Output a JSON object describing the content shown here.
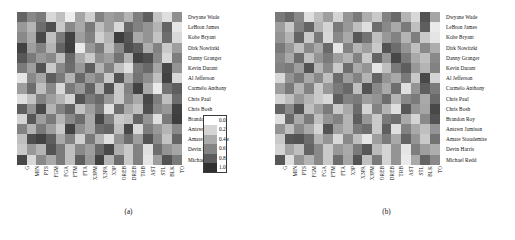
{
  "figure": {
    "panels": [
      {
        "id": "a",
        "caption": "(a)"
      },
      {
        "id": "b",
        "caption": "(b)"
      }
    ]
  },
  "legend": {
    "ticks": [
      "0.0",
      "0.2",
      "0.4",
      "0.6",
      "0.8",
      "1.0"
    ],
    "colors": [
      "#ffffff",
      "#d4d4d4",
      "#ababab",
      "#848484",
      "#5c5c5c",
      "#303030"
    ]
  },
  "chart_data": [
    {
      "type": "heatmap",
      "title": "(a)",
      "xlabel": "",
      "ylabel": "",
      "colormap": "greys",
      "zlim": [
        0.0,
        1.0
      ],
      "grid": false,
      "legend_position": "right",
      "categories": [
        "G",
        "MIN",
        "PTS",
        "FGM",
        "FGA",
        "FTM",
        "FTA",
        "X3PM",
        "X3PA",
        "X3P",
        "OREB",
        "DREB",
        "TRB",
        "AST",
        "STL",
        "BLK",
        "TO"
      ],
      "rows": [
        "Dwyane Wade",
        "LeBron James",
        "Kobe Bryant",
        "Dirk Nowitzki",
        "Danny Granger",
        "Kevin Durant",
        "Al Jefferson",
        "Carmelo Anthony",
        "Chris Paul",
        "Chris Bosh",
        "Brandon Roy",
        "Antawn Jamison",
        "Amare Stoudemire",
        "Devin Harris",
        "Michael Redd"
      ],
      "values": [
        [
          0.72,
          0.55,
          0.62,
          0.18,
          0.3,
          0.08,
          0.42,
          0.22,
          0.58,
          0.45,
          0.5,
          0.35,
          0.6,
          0.75,
          0.28,
          0.15,
          0.52
        ],
        [
          0.48,
          0.35,
          0.68,
          0.82,
          0.25,
          0.55,
          0.4,
          0.62,
          0.3,
          0.45,
          0.18,
          0.7,
          0.58,
          0.5,
          0.35,
          0.72,
          0.12
        ],
        [
          0.55,
          0.4,
          0.85,
          0.3,
          0.62,
          0.88,
          0.45,
          0.58,
          0.22,
          0.35,
          0.9,
          0.78,
          0.4,
          0.5,
          0.28,
          0.68,
          0.18
        ],
        [
          0.88,
          0.45,
          0.58,
          0.35,
          0.72,
          0.9,
          0.1,
          0.48,
          0.62,
          0.3,
          0.55,
          0.82,
          0.75,
          0.38,
          0.58,
          0.25,
          0.45
        ],
        [
          0.78,
          0.62,
          0.48,
          0.55,
          0.3,
          0.7,
          0.4,
          0.25,
          0.52,
          0.45,
          0.65,
          0.35,
          0.88,
          0.82,
          0.55,
          0.18,
          0.6
        ],
        [
          0.62,
          0.45,
          0.8,
          0.25,
          0.55,
          0.68,
          0.48,
          0.75,
          0.35,
          0.58,
          0.3,
          0.15,
          0.62,
          0.7,
          0.42,
          0.85,
          0.5
        ],
        [
          0.12,
          0.55,
          0.42,
          0.75,
          0.62,
          0.35,
          0.7,
          0.48,
          0.58,
          0.25,
          0.8,
          0.4,
          0.65,
          0.52,
          0.3,
          0.88,
          0.18
        ],
        [
          0.45,
          0.68,
          0.3,
          0.55,
          0.18,
          0.62,
          0.48,
          0.72,
          0.35,
          0.8,
          0.25,
          0.58,
          0.88,
          0.4,
          0.1,
          0.65,
          0.75
        ],
        [
          0.15,
          0.28,
          0.58,
          0.45,
          0.35,
          0.2,
          0.8,
          0.62,
          0.7,
          0.48,
          0.25,
          0.55,
          0.4,
          0.85,
          0.6,
          0.3,
          0.68
        ],
        [
          0.75,
          0.5,
          0.85,
          0.35,
          0.58,
          0.72,
          0.28,
          0.45,
          0.62,
          0.15,
          0.68,
          0.4,
          0.3,
          0.82,
          0.55,
          0.48,
          0.88
        ],
        [
          0.2,
          0.78,
          0.45,
          0.62,
          0.35,
          0.55,
          0.68,
          0.4,
          0.85,
          0.58,
          0.25,
          0.3,
          0.72,
          0.5,
          0.15,
          0.62,
          0.9
        ],
        [
          0.58,
          0.35,
          0.62,
          0.45,
          0.25,
          0.88,
          0.52,
          0.4,
          0.68,
          0.72,
          0.3,
          0.85,
          0.18,
          0.6,
          0.48,
          0.35,
          0.55
        ],
        [
          0.3,
          0.82,
          0.88,
          0.75,
          0.4,
          0.58,
          0.22,
          0.62,
          0.35,
          0.15,
          0.5,
          0.68,
          0.45,
          0.8,
          0.55,
          0.28,
          0.72
        ],
        [
          0.25,
          0.48,
          0.35,
          0.8,
          0.62,
          0.3,
          0.55,
          0.45,
          0.7,
          0.85,
          0.38,
          0.25,
          0.58,
          0.15,
          0.68,
          0.5,
          0.42
        ],
        [
          0.85,
          0.18,
          0.55,
          0.4,
          0.62,
          0.3,
          0.75,
          0.48,
          0.88,
          0.35,
          0.68,
          0.25,
          0.58,
          0.12,
          0.45,
          0.8,
          0.62
        ]
      ]
    },
    {
      "type": "heatmap",
      "title": "(b)",
      "xlabel": "",
      "ylabel": "",
      "colormap": "greys",
      "zlim": [
        0.0,
        1.0
      ],
      "grid": false,
      "legend_position": "right",
      "categories": [
        "G",
        "MIN",
        "PTS",
        "FGM",
        "FGA",
        "FTM",
        "FTA",
        "X3P",
        "X3PA",
        "X3PM",
        "OREB",
        "DREB",
        "TRB",
        "AST",
        "STL",
        "BLK",
        "TO"
      ],
      "rows": [
        "Dwyane Wade",
        "LeBron James",
        "Kobe Bryant",
        "Dirk Nowitzki",
        "Danny Granger",
        "Kevin Durant",
        "Al Jefferson",
        "Carmelo Anthony",
        "Chris Paul",
        "Chris Bosh",
        "Brandon Roy",
        "Antawn Jamison",
        "Amare Stoudemire",
        "Devin Harris",
        "Michael Redd"
      ],
      "values": [
        [
          0.62,
          0.7,
          0.55,
          0.15,
          0.3,
          0.45,
          0.2,
          0.5,
          0.62,
          0.38,
          0.25,
          0.58,
          0.7,
          0.35,
          0.18,
          0.8,
          0.42
        ],
        [
          0.45,
          0.25,
          0.58,
          0.72,
          0.35,
          0.2,
          0.62,
          0.48,
          0.3,
          0.15,
          0.68,
          0.55,
          0.4,
          0.62,
          0.3,
          0.75,
          0.1
        ],
        [
          0.5,
          0.35,
          0.72,
          0.25,
          0.62,
          0.18,
          0.55,
          0.4,
          0.78,
          0.65,
          0.3,
          0.48,
          0.58,
          0.35,
          0.6,
          0.25,
          0.12
        ],
        [
          0.62,
          0.48,
          0.3,
          0.55,
          0.4,
          0.7,
          0.12,
          0.58,
          0.35,
          0.45,
          0.25,
          0.8,
          0.68,
          0.5,
          0.3,
          0.55,
          0.38
        ],
        [
          0.55,
          0.4,
          0.68,
          0.3,
          0.5,
          0.62,
          0.45,
          0.35,
          0.58,
          0.25,
          0.72,
          0.48,
          0.85,
          0.62,
          0.4,
          0.3,
          0.55
        ],
        [
          0.58,
          0.62,
          0.45,
          0.8,
          0.35,
          0.55,
          0.25,
          0.68,
          0.4,
          0.5,
          0.12,
          0.3,
          0.62,
          0.75,
          0.48,
          0.35,
          0.58
        ],
        [
          0.18,
          0.5,
          0.62,
          0.4,
          0.55,
          0.3,
          0.68,
          0.45,
          0.58,
          0.35,
          0.72,
          0.5,
          0.4,
          0.62,
          0.25,
          0.85,
          0.2
        ],
        [
          0.45,
          0.62,
          0.35,
          0.58,
          0.25,
          0.48,
          0.62,
          0.7,
          0.3,
          0.8,
          0.55,
          0.4,
          0.68,
          0.15,
          0.5,
          0.75,
          0.62
        ],
        [
          0.2,
          0.3,
          0.48,
          0.35,
          0.25,
          0.18,
          0.75,
          0.58,
          0.62,
          0.45,
          0.5,
          0.68,
          0.35,
          0.55,
          0.62,
          0.4,
          0.7
        ],
        [
          0.72,
          0.55,
          0.8,
          0.3,
          0.45,
          0.62,
          0.25,
          0.4,
          0.68,
          0.2,
          0.58,
          0.35,
          0.15,
          0.78,
          0.5,
          0.42,
          0.85
        ],
        [
          0.15,
          0.7,
          0.4,
          0.62,
          0.3,
          0.5,
          0.58,
          0.35,
          0.75,
          0.48,
          0.25,
          0.62,
          0.68,
          0.4,
          0.2,
          0.55,
          0.8
        ],
        [
          0.5,
          0.3,
          0.55,
          0.4,
          0.2,
          0.8,
          0.45,
          0.35,
          0.62,
          0.68,
          0.25,
          0.75,
          0.15,
          0.58,
          0.4,
          0.3,
          0.5
        ],
        [
          0.25,
          0.78,
          0.8,
          0.68,
          0.35,
          0.5,
          0.18,
          0.55,
          0.3,
          0.12,
          0.45,
          0.62,
          0.4,
          0.72,
          0.5,
          0.25,
          0.65
        ],
        [
          0.2,
          0.42,
          0.3,
          0.72,
          0.55,
          0.25,
          0.48,
          0.4,
          0.62,
          0.78,
          0.32,
          0.2,
          0.5,
          0.12,
          0.6,
          0.45,
          0.38
        ],
        [
          0.78,
          0.15,
          0.5,
          0.35,
          0.55,
          0.25,
          0.68,
          0.42,
          0.8,
          0.3,
          0.62,
          0.2,
          0.5,
          0.1,
          0.4,
          0.72,
          0.55
        ]
      ]
    }
  ]
}
